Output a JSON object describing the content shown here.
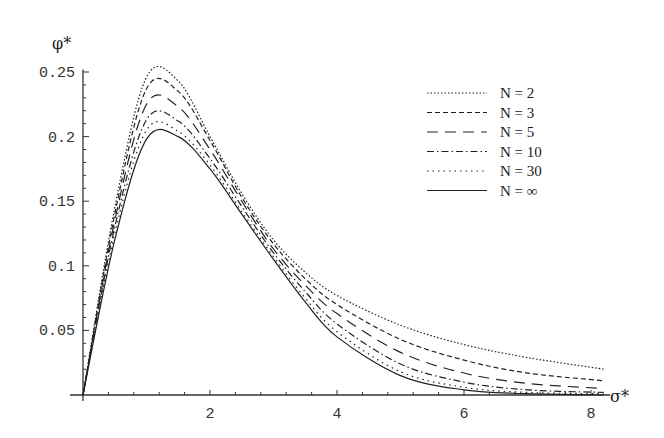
{
  "chart_data": {
    "type": "line",
    "title": "",
    "xlabel": "σ*",
    "ylabel": "φ*",
    "xlim": [
      0,
      8.3
    ],
    "ylim": [
      0,
      0.25
    ],
    "grid": false,
    "legend_position": "upper right",
    "x_ticks": [
      "2",
      "4",
      "6",
      "8"
    ],
    "y_ticks": [
      "0.05",
      "0.1",
      "0.15",
      "0.2",
      "0.25"
    ],
    "x": [
      0,
      0.5,
      1,
      1.5,
      2,
      2.5,
      3,
      3.5,
      4,
      5,
      6,
      7,
      8.2
    ],
    "series": [
      {
        "name": "N = 2",
        "style": "dotted-fine",
        "values": [
          0,
          0.145,
          0.246,
          0.243,
          0.2,
          0.156,
          0.12,
          0.095,
          0.077,
          0.054,
          0.039,
          0.029,
          0.02
        ]
      },
      {
        "name": "N = 3",
        "style": "dashed-short",
        "values": [
          0,
          0.14,
          0.237,
          0.235,
          0.197,
          0.153,
          0.117,
          0.09,
          0.07,
          0.043,
          0.027,
          0.017,
          0.011
        ]
      },
      {
        "name": "N = 5",
        "style": "dashed-long",
        "values": [
          0,
          0.135,
          0.225,
          0.223,
          0.19,
          0.15,
          0.113,
          0.085,
          0.063,
          0.033,
          0.017,
          0.009,
          0.005
        ]
      },
      {
        "name": "N = 10",
        "style": "dash-dot",
        "values": [
          0,
          0.13,
          0.213,
          0.212,
          0.183,
          0.146,
          0.11,
          0.08,
          0.055,
          0.024,
          0.01,
          0.004,
          0.002
        ]
      },
      {
        "name": "N = 30",
        "style": "dotted-sparse",
        "values": [
          0,
          0.125,
          0.205,
          0.204,
          0.178,
          0.142,
          0.107,
          0.075,
          0.049,
          0.018,
          0.006,
          0.002,
          0.001
        ]
      },
      {
        "name": "N = ∞",
        "style": "solid",
        "values": [
          0,
          0.12,
          0.198,
          0.2,
          0.175,
          0.14,
          0.105,
          0.072,
          0.045,
          0.015,
          0.004,
          0.001,
          0.0
        ]
      }
    ]
  }
}
